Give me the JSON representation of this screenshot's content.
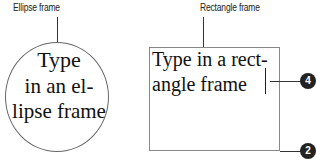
{
  "ellipse_frame": {
    "label": "Ellipse frame",
    "lines": [
      "Type",
      "in an el-",
      "lipse frame"
    ]
  },
  "rectangle_frame": {
    "label": "Rectangle frame",
    "lines": [
      "Type in a rect-",
      "angle frame"
    ]
  },
  "callouts": [
    {
      "number": "4"
    },
    {
      "number": "2"
    }
  ]
}
